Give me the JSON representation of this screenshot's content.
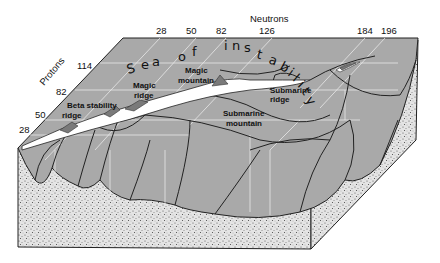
{
  "axes": {
    "neutrons": {
      "label": "Neutrons",
      "ticks": [
        "28",
        "50",
        "82",
        "126",
        "184",
        "196"
      ]
    },
    "protons": {
      "label": "Protons",
      "ticks": [
        "28",
        "50",
        "82",
        "114"
      ]
    }
  },
  "sea_label": "Sea of instability",
  "sea_letters": [
    "S",
    "e",
    "a",
    "o",
    "f",
    "i",
    "n",
    "s",
    "t",
    "a",
    "b",
    "i",
    "l",
    "i",
    "t",
    "y"
  ],
  "annotations": {
    "beta_stability_ridge_1": "Beta stability",
    "beta_stability_ridge_2": "ridge",
    "magic_ridge_1": "Magic",
    "magic_ridge_2": "ridge",
    "magic_mountain_1": "Magic",
    "magic_mountain_2": "mountain",
    "submarine_ridge_1": "Submarine",
    "submarine_ridge_2": "ridge",
    "submarine_mountain_1": "Submarine",
    "submarine_mountain_2": "mountain"
  },
  "colors": {
    "surface": "#a9a9a9",
    "grid": "#e6e6e6",
    "ridge": "#ffffff",
    "peaks": "#7a7a7a",
    "ground": "#dcdcdc",
    "outline": "#222222"
  }
}
